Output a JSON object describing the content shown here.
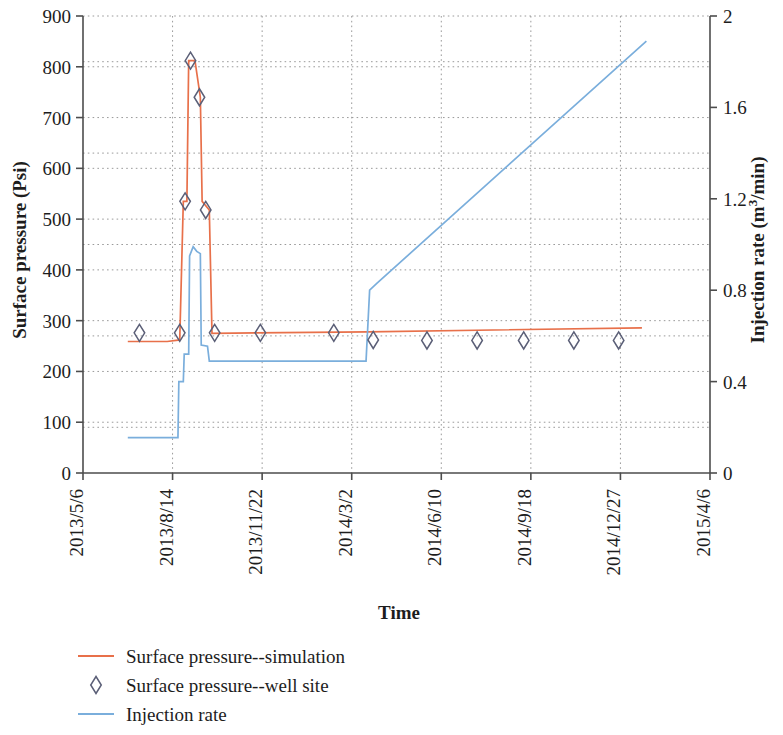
{
  "chart_data": {
    "type": "line",
    "title": "",
    "xlabel": "Time",
    "ylabel": "Surface pressure (Psi)",
    "y2label": "Injection rate (m3/min)",
    "ylim": [
      0,
      900
    ],
    "y2lim": [
      0,
      2
    ],
    "xlim": [
      "2013/5/6",
      "2015/4/6"
    ],
    "grid": true,
    "legend_position": "bottom-left",
    "y_ticks": [
      0,
      100,
      200,
      300,
      400,
      500,
      600,
      700,
      800,
      900
    ],
    "y2_ticks": [
      "0",
      "0.4",
      "0.8",
      "1.2",
      "1.6",
      "2"
    ],
    "x_ticks": [
      "2013/5/6",
      "2013/8/14",
      "2013/11/22",
      "2014/3/2",
      "2014/6/10",
      "2014/9/18",
      "2014/12/27",
      "2015/4/6"
    ],
    "series": [
      {
        "name": "Surface pressure--simulation",
        "type": "line",
        "axis": "left",
        "color": "#e8704a",
        "points": [
          {
            "x": "2013/6/25",
            "y": 259
          },
          {
            "x": "2013/8/8",
            "y": 259
          },
          {
            "x": "2013/8/22",
            "y": 262
          },
          {
            "x": "2013/8/26",
            "y": 535
          },
          {
            "x": "2013/8/30",
            "y": 535
          },
          {
            "x": "2013/9/1",
            "y": 812
          },
          {
            "x": "2013/9/8",
            "y": 812
          },
          {
            "x": "2013/9/14",
            "y": 740
          },
          {
            "x": "2013/9/16",
            "y": 535
          },
          {
            "x": "2013/9/24",
            "y": 518
          },
          {
            "x": "2013/9/27",
            "y": 275
          },
          {
            "x": "2014/3/20",
            "y": 278
          },
          {
            "x": "2015/1/20",
            "y": 286
          }
        ]
      },
      {
        "name": "Surface pressure--well site",
        "type": "scatter",
        "axis": "left",
        "marker": "diamond",
        "color": "#5b5f77",
        "points": [
          {
            "x": "2013/7/8",
            "y": 276
          },
          {
            "x": "2013/8/22",
            "y": 276
          },
          {
            "x": "2013/8/28",
            "y": 535
          },
          {
            "x": "2013/9/3",
            "y": 812
          },
          {
            "x": "2013/9/13",
            "y": 740
          },
          {
            "x": "2013/9/20",
            "y": 518
          },
          {
            "x": "2013/9/30",
            "y": 276
          },
          {
            "x": "2013/11/20",
            "y": 276
          },
          {
            "x": "2014/2/10",
            "y": 276
          },
          {
            "x": "2014/3/26",
            "y": 262
          },
          {
            "x": "2014/5/25",
            "y": 261
          },
          {
            "x": "2014/7/20",
            "y": 261
          },
          {
            "x": "2014/9/10",
            "y": 261
          },
          {
            "x": "2014/11/5",
            "y": 261
          },
          {
            "x": "2014/12/25",
            "y": 261
          }
        ]
      },
      {
        "name": "Injection rate",
        "type": "line",
        "axis": "right",
        "color": "#7aaedc",
        "points": [
          {
            "x": "2013/6/25",
            "y": 0.155
          },
          {
            "x": "2013/8/20",
            "y": 0.155
          },
          {
            "x": "2013/8/21",
            "y": 0.4
          },
          {
            "x": "2013/8/26",
            "y": 0.4
          },
          {
            "x": "2013/8/27",
            "y": 0.52
          },
          {
            "x": "2013/9/1",
            "y": 0.52
          },
          {
            "x": "2013/9/2",
            "y": 0.95
          },
          {
            "x": "2013/9/6",
            "y": 0.99
          },
          {
            "x": "2013/9/10",
            "y": 0.97
          },
          {
            "x": "2013/9/14",
            "y": 0.96
          },
          {
            "x": "2013/9/15",
            "y": 0.56
          },
          {
            "x": "2013/9/22",
            "y": 0.555
          },
          {
            "x": "2013/9/24",
            "y": 0.49
          },
          {
            "x": "2014/3/18",
            "y": 0.49
          },
          {
            "x": "2014/3/22",
            "y": 0.8
          },
          {
            "x": "2014/3/30",
            "y": 0.83
          },
          {
            "x": "2015/1/25",
            "y": 1.89
          }
        ]
      }
    ]
  },
  "axes": {
    "left_title": "Surface pressure (Psi)",
    "right_title_pre": "Injection rate (m",
    "right_title_sup": "3",
    "right_title_post": "/min)",
    "bottom_title": "Time"
  },
  "legend": {
    "items": [
      {
        "label": "Surface pressure--simulation",
        "symbol": "line",
        "color": "#e8704a"
      },
      {
        "label": "Surface pressure--well site",
        "symbol": "diamond",
        "color": "#5b5f77"
      },
      {
        "label": "Injection rate",
        "symbol": "line",
        "color": "#7aaedc"
      }
    ]
  }
}
